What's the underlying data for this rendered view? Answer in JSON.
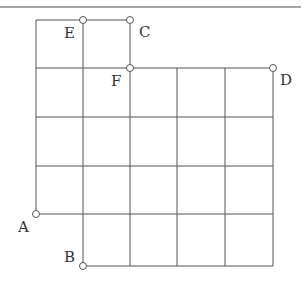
{
  "diagram": {
    "type": "grid-path",
    "colors": {
      "line": "#555555",
      "rule": "#888888",
      "point_fill": "#ffffff",
      "label": "#333333"
    },
    "points": [
      {
        "id": "A",
        "label": "A",
        "x": 36,
        "y": 214,
        "lx": 18,
        "ly": 232
      },
      {
        "id": "B",
        "label": "B",
        "x": 83,
        "y": 266,
        "lx": 64,
        "ly": 262
      },
      {
        "id": "C",
        "label": "C",
        "x": 130,
        "y": 20,
        "lx": 139,
        "ly": 37
      },
      {
        "id": "D",
        "label": "D",
        "x": 273,
        "y": 68,
        "lx": 280,
        "ly": 85
      },
      {
        "id": "E",
        "label": "E",
        "x": 83,
        "y": 20,
        "lx": 64,
        "ly": 38
      },
      {
        "id": "F",
        "label": "F",
        "x": 130,
        "y": 68,
        "lx": 111,
        "ly": 86
      }
    ]
  }
}
